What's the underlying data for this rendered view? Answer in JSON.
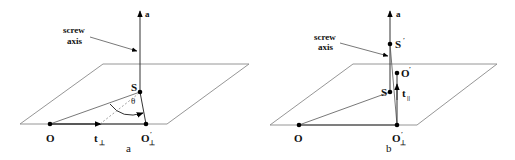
{
  "figure": {
    "panels": [
      {
        "id": "a",
        "caption": "a",
        "labels": {
          "axis_vector": "a",
          "screw_line1": "screw",
          "screw_line2": "axis",
          "point_S": "S",
          "point_O": "O",
          "point_O_perp": "O",
          "point_O_perp_prime": "′",
          "point_O_perp_sub": "⊥",
          "translation": "t",
          "translation_sub": "⊥",
          "angle": "θ"
        }
      },
      {
        "id": "b",
        "caption": "b",
        "labels": {
          "axis_vector": "a",
          "screw_line1": "screw",
          "screw_line2": "axis",
          "point_S": "S",
          "point_S_prime": "S",
          "prime": "′",
          "point_O_prime": "O",
          "point_O": "O",
          "point_O_perp": "O",
          "point_O_perp_sub": "⊥",
          "translation": "t",
          "translation_sub": "||"
        }
      }
    ],
    "colors": {
      "lines": "#333333",
      "plane": "#8a8a8a",
      "points": "#000000"
    }
  }
}
